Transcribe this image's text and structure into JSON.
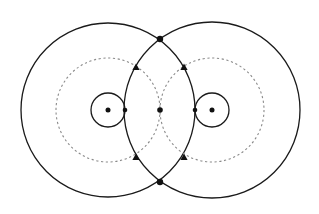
{
  "diagram": {
    "colors": {
      "background": "#ffffff",
      "solid_stroke": "#1a1a1a",
      "dashed_stroke": "#8a8a8a",
      "points": "#111111"
    },
    "large_circles": [
      {
        "id": "left-large",
        "cx": 108,
        "cy": 110,
        "r": 87
      },
      {
        "id": "right-large",
        "cx": 212,
        "cy": 110,
        "r": 88
      }
    ],
    "dashed_circles": [
      {
        "id": "left-dashed",
        "cx": 108,
        "cy": 110,
        "r": 52
      },
      {
        "id": "right-dashed",
        "cx": 212,
        "cy": 110,
        "r": 52
      }
    ],
    "small_circles": [
      {
        "id": "left-small",
        "cx": 108,
        "cy": 110,
        "r": 17
      },
      {
        "id": "right-small",
        "cx": 212,
        "cy": 110,
        "r": 17
      }
    ],
    "points": [
      {
        "id": "top-intersection",
        "x": 160,
        "y": 39,
        "r": 3.2
      },
      {
        "id": "bottom-intersection",
        "x": 160,
        "y": 182,
        "r": 3.2
      },
      {
        "id": "center",
        "x": 160,
        "y": 110,
        "r": 2.8
      },
      {
        "id": "left-center",
        "x": 108,
        "y": 110,
        "r": 2.5
      },
      {
        "id": "right-center",
        "x": 212,
        "y": 110,
        "r": 2.5
      },
      {
        "id": "left-small-touch",
        "x": 125,
        "y": 110,
        "r": 2.3
      },
      {
        "id": "right-small-touch",
        "x": 195,
        "y": 110,
        "r": 2.3
      }
    ],
    "arrows": [
      {
        "id": "arrow-top-left",
        "x": 136,
        "y": 67,
        "dir": "up"
      },
      {
        "id": "arrow-top-right",
        "x": 184,
        "y": 67,
        "dir": "up"
      },
      {
        "id": "arrow-bottom-left",
        "x": 136,
        "y": 157,
        "dir": "up"
      },
      {
        "id": "arrow-bottom-right",
        "x": 184,
        "y": 157,
        "dir": "up"
      }
    ]
  }
}
